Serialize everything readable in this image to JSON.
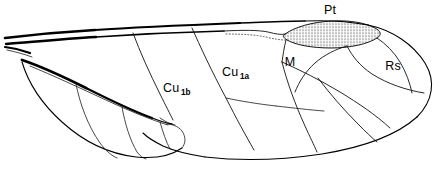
{
  "figure": {
    "background_color": "#ffffff",
    "ink_color": "#000000",
    "width": 447,
    "height": 179
  },
  "labels": {
    "pterostigma": {
      "text": "Pt",
      "x": 330,
      "y": 14
    },
    "media": {
      "text": "M",
      "x": 290,
      "y": 66
    },
    "radial_sector": {
      "text": "Rs",
      "x": 393,
      "y": 70
    },
    "cubitus_1a": {
      "base": "Cu",
      "sub": "1a",
      "x": 222,
      "y": 76
    },
    "cubitus_1b": {
      "base": "Cu",
      "sub": "1b",
      "x": 163,
      "y": 92
    }
  },
  "features": {
    "stigma_name": "pterostigma-stipple",
    "stigma_fill": "#ffffff",
    "stipple_dot_color": "#1a1a1a",
    "anal_lobe_name": "anal-lobe",
    "wing_tip_name": "wing-apex",
    "wing_base_name": "wing-base"
  }
}
